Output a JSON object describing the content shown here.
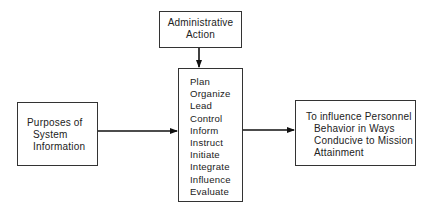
{
  "diagram": {
    "top_box": {
      "lines": [
        "Administrative",
        "Action"
      ]
    },
    "left_box": {
      "lines": [
        "Purposes of",
        "System",
        "Information"
      ]
    },
    "middle_box": {
      "items": [
        "Plan",
        "Organize",
        "Lead",
        "Control",
        "Inform",
        "Instruct",
        "Initiate",
        "Integrate",
        "Influence",
        "Evaluate"
      ]
    },
    "right_box": {
      "lines": [
        "To influence Personnel",
        "Behavior in Ways",
        "Conducive to Mission",
        "Attainment"
      ]
    },
    "edges": [
      {
        "from": "top_box",
        "to": "middle_box"
      },
      {
        "from": "left_box",
        "to": "middle_box"
      },
      {
        "from": "middle_box",
        "to": "right_box"
      }
    ]
  }
}
